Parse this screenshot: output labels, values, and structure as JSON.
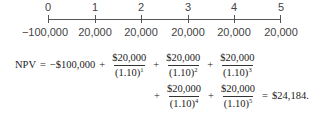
{
  "timeline": {
    "periods": [
      "0",
      "1",
      "2",
      "3",
      "4",
      "5"
    ],
    "cash_flows": [
      "−100,000",
      "20,000",
      "20,000",
      "20,000",
      "20,000",
      "20,000"
    ]
  },
  "formula": {
    "lhs": "NPV",
    "equals": "=",
    "initial": "−$100,000",
    "plus": "+",
    "terms": [
      {
        "num": "$20,000",
        "den": "(1.10)",
        "exp": "1"
      },
      {
        "num": "$20,000",
        "den": "(1.10)",
        "exp": "2"
      },
      {
        "num": "$20,000",
        "den": "(1.10)",
        "exp": "3"
      },
      {
        "num": "$20,000",
        "den": "(1.10)",
        "exp": "4"
      },
      {
        "num": "$20,000",
        "den": "(1.10)",
        "exp": "5"
      }
    ],
    "result": "$24,184."
  }
}
